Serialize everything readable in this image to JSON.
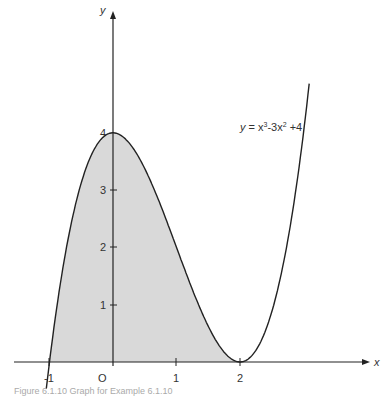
{
  "chart_data": {
    "type": "line",
    "title": "",
    "function_label": "y = x³-3x² +4",
    "xlabel": "x",
    "ylabel": "y",
    "x_ticks": [
      "-1",
      "O",
      "1",
      "2"
    ],
    "y_ticks": [
      "1",
      "2",
      "3",
      "4"
    ],
    "xlim": [
      -1.05,
      3.1
    ],
    "ylim": [
      0,
      6.1
    ],
    "shaded_region": {
      "from_x": -1,
      "to_x": 2,
      "description": "area under curve between x=-1 and x=2"
    },
    "series": [
      {
        "name": "y = x^3 - 3x^2 + 4",
        "x": [
          -1,
          -0.5,
          0,
          0.5,
          1,
          1.5,
          2,
          2.5,
          3,
          3.1
        ],
        "values": [
          0,
          3.125,
          4,
          3.375,
          2,
          0.875,
          0,
          0.875,
          4,
          4.96
        ]
      }
    ],
    "grid": false
  },
  "labels": {
    "x_axis": "x",
    "y_axis": "y",
    "origin": "O",
    "x_m1": "-1",
    "x_1": "1",
    "x_2": "2",
    "y_1": "1",
    "y_2": "2",
    "y_3": "3",
    "y_4": "4",
    "eq_y": "y",
    "eq_rest": " = x",
    "eq_sup1": "3",
    "eq_mid": "-3x",
    "eq_sup2": "2",
    "eq_end": " +4"
  },
  "caption": "Figure 6.1.10   Graph for Example 6.1.10"
}
